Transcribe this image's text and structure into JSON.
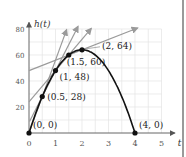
{
  "chart_data": {
    "type": "line",
    "title": "",
    "function": "h(t) = 64t - 16t^2",
    "xlabel": "t",
    "ylabel": "h(t)",
    "xlim": [
      0,
      5
    ],
    "ylim": [
      0,
      80
    ],
    "x_ticks": [
      0,
      1,
      2,
      3,
      4,
      5
    ],
    "y_ticks": [
      20,
      40,
      60,
      80
    ],
    "grid": true,
    "series": [
      {
        "name": "h(t)",
        "x": [
          0,
          0.5,
          1,
          1.5,
          2,
          2.5,
          3,
          3.5,
          4
        ],
        "values": [
          0,
          28,
          48,
          60,
          64,
          60,
          48,
          28,
          0
        ]
      }
    ],
    "points": [
      {
        "x": 0,
        "y": 0,
        "label": "(0, 0)"
      },
      {
        "x": 0.5,
        "y": 28,
        "label": "(0.5, 28)"
      },
      {
        "x": 1,
        "y": 48,
        "label": "(1, 48)"
      },
      {
        "x": 1.5,
        "y": 60,
        "label": "(1.5, 60)"
      },
      {
        "x": 2,
        "y": 64,
        "label": "(2, 64)"
      },
      {
        "x": 4,
        "y": 0,
        "label": "(4, 0)"
      }
    ],
    "secant_lines": [
      {
        "slope": 56,
        "intercept": 0,
        "through": [
          [
            0,
            0
          ],
          [
            0.5,
            28
          ]
        ]
      },
      {
        "slope": 40,
        "intercept": 8,
        "through": [
          [
            0.5,
            28
          ],
          [
            1,
            48
          ]
        ]
      },
      {
        "slope": 24,
        "intercept": 24,
        "through": [
          [
            1,
            48
          ],
          [
            1.5,
            60
          ]
        ]
      },
      {
        "slope": 8,
        "intercept": 48,
        "through": [
          [
            1.5,
            60
          ],
          [
            2,
            64
          ]
        ]
      }
    ],
    "colors": {
      "curve": "#111111",
      "secant": "#9a9a9a",
      "grid": "#e4e4e4",
      "axis": "#888888"
    }
  }
}
